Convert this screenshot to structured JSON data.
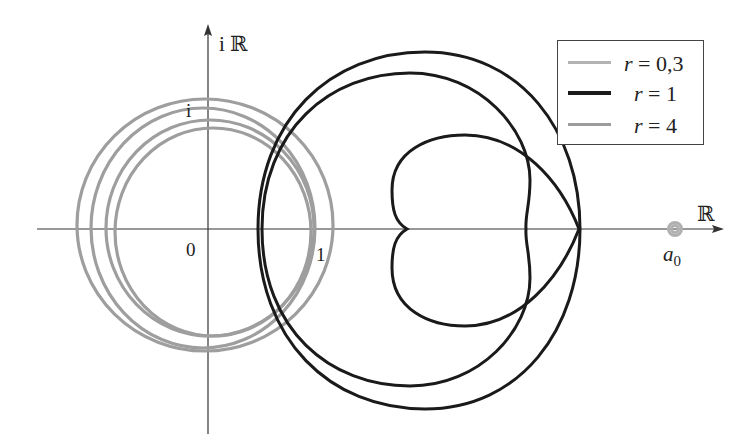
{
  "figure": {
    "axes": {
      "x_label": "ℝ",
      "y_label": "i ℝ",
      "origin_label": "0",
      "x_unit_label": "1",
      "y_unit_label": "i",
      "point_label": "a",
      "point_subscript": "0"
    },
    "legend": {
      "items": [
        {
          "var": "r",
          "eq": " = 0,3",
          "color": "#b3b3b3"
        },
        {
          "var": "r",
          "eq": " = 1",
          "color": "#1a1a1a"
        },
        {
          "var": "r",
          "eq": " = 4",
          "color": "#9c9c9c"
        }
      ]
    },
    "colors": {
      "axis": "#333333",
      "curve_r1": "#1a1a1a",
      "curve_r4": "#9e9e9e",
      "curve_r03": "#b0b0b0"
    }
  }
}
